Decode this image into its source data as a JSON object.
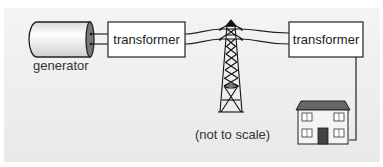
{
  "diagram": {
    "components": {
      "generator": {
        "label": "generator"
      },
      "step_up_transformer": {
        "label": "transformer"
      },
      "pylon": {
        "label": ""
      },
      "step_down_transformer": {
        "label": "transformer"
      },
      "house": {
        "label": ""
      }
    },
    "note": "(not to scale)",
    "colors": {
      "background": "#ececec",
      "line": "#222222",
      "box_fill": "#ffffff",
      "roof": "#666666",
      "door": "#444444"
    }
  }
}
